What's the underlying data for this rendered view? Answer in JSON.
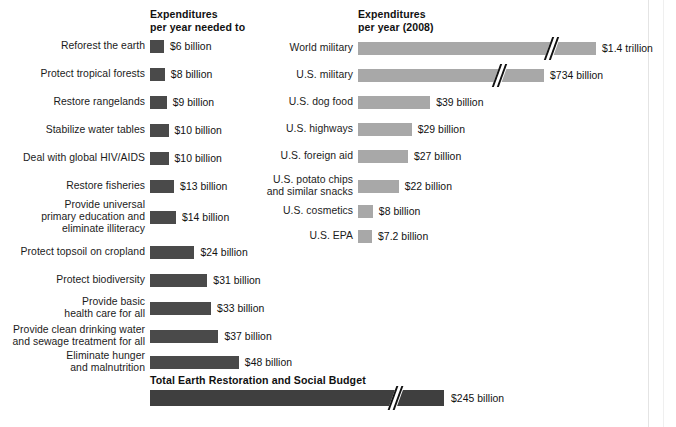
{
  "chart_data": {
    "type": "bar",
    "title": "",
    "orientation": "horizontal",
    "xlabel": "",
    "ylabel": "",
    "grid": false,
    "legend_position": "none",
    "units": "US dollars per year",
    "scale_px_per_billion": 1.85,
    "colors": {
      "needed_bar": "#4a4a4a",
      "actual_bar": "#a8a8a8",
      "total_bar": "#3f3f3f",
      "text": "#111111",
      "background": "#ffffff"
    },
    "panels": [
      {
        "id": "needed",
        "heading": "Expenditures\nper year needed to",
        "bar_color": "#4a4a4a",
        "categories": [
          "Reforest the earth",
          "Protect tropical forests",
          "Restore rangelands",
          "Stabilize water tables",
          "Deal with global HIV/AIDS",
          "Restore fisheries",
          "Provide universal\nprimary education and\neliminate illiteracy",
          "Protect topsoil on cropland",
          "Protect biodiversity",
          "Provide basic\nhealth care for all",
          "Provide clean drinking water\nand sewage treatment for all",
          "Eliminate hunger\nand malnutrition"
        ],
        "values": [
          6,
          8,
          9,
          10,
          10,
          13,
          14,
          24,
          31,
          33,
          37,
          48
        ],
        "value_labels": [
          "$6 billion",
          "$8 billion",
          "$9 billion",
          "$10 billion",
          "$10 billion",
          "$13 billion",
          "$14 billion",
          "$24 billion",
          "$31 billion",
          "$33 billion",
          "$37 billion",
          "$48 billion"
        ]
      },
      {
        "id": "actual",
        "heading": "Expenditures\nper year (2008)",
        "bar_color": "#a8a8a8",
        "categories": [
          "World military",
          "U.S. military",
          "U.S. dog food",
          "U.S. highways",
          "U.S. foreign aid",
          "U.S. potato chips\nand similar snacks",
          "U.S. cosmetics",
          "U.S. EPA"
        ],
        "values": [
          1400,
          734,
          39,
          29,
          27,
          22,
          8,
          7.2
        ],
        "value_labels": [
          "$1.4 trillion",
          "$734 billion",
          "$39 billion",
          "$29 billion",
          "$27 billion",
          "$22 billion",
          "$8 billion",
          "$7.2 billion"
        ],
        "axis_break_rows": [
          0,
          1
        ]
      }
    ],
    "total": {
      "title": "Total Earth Restoration and Social Budget",
      "value": 245,
      "value_label": "$245 billion",
      "axis_break": true
    }
  },
  "layout": {
    "left_bar_x": 150,
    "right_bar_x": 358,
    "bar_height": 13,
    "left_rows_y": [
      40,
      68,
      96,
      124,
      152,
      180,
      211,
      246,
      274,
      302,
      330,
      356
    ],
    "right_rows_y": [
      42,
      69,
      96,
      123,
      150,
      180,
      205,
      230
    ],
    "total_bar_y": 390
  }
}
